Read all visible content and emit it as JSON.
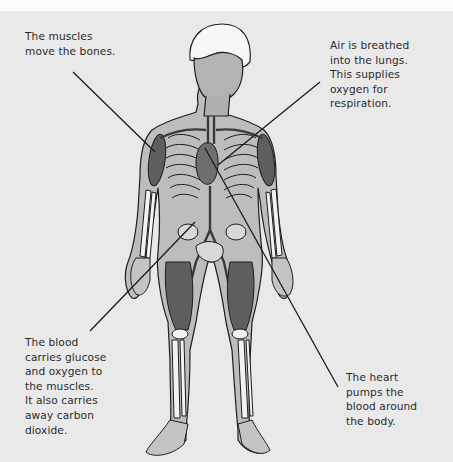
{
  "diagram": {
    "labels": [
      {
        "id": "muscles",
        "text": "The muscles\nmove the bones."
      },
      {
        "id": "lungs",
        "text": "Air is breathed\ninto the lungs.\nThis supplies\noxygen for\nrespiration."
      },
      {
        "id": "blood",
        "text": "The blood\ncarries glucose\nand oxygen to\nthe muscles.\nIt also carries\naway carbon\ndioxide."
      },
      {
        "id": "heart",
        "text": "The heart\npumps the\nblood around\nthe body."
      }
    ],
    "leader_lines": [
      {
        "label": "muscles",
        "from": [
          73,
          72
        ],
        "to": [
          155,
          152
        ]
      },
      {
        "label": "lungs",
        "from": [
          320,
          82
        ],
        "to": [
          218,
          165
        ]
      },
      {
        "label": "blood",
        "from": [
          90,
          331
        ],
        "to": [
          195,
          222
        ]
      },
      {
        "label": "heart",
        "from": [
          205,
          148
        ],
        "to": [
          338,
          387
        ]
      }
    ],
    "colors": {
      "background": "#e9e9e9",
      "skin": "#bdbdbd",
      "muscle": "#5e5e5e",
      "bone": "#f2f2f2",
      "outline": "#1e1e1e",
      "hair": "#f7f7f7",
      "text": "#2b2b2b"
    }
  }
}
